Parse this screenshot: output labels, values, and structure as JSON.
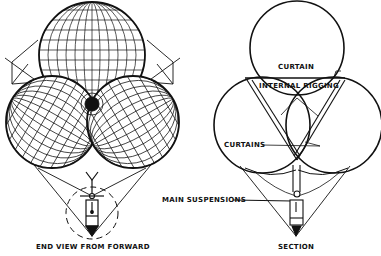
{
  "figures": {
    "left": {
      "caption": "END VIEW FROM FORWARD"
    },
    "right": {
      "caption": "SECTION",
      "labels": {
        "curtain": "CURTAIN",
        "internal_rigging": "INTERNAL RIGGING",
        "curtains": "CURTAINS",
        "main_suspensions": "MAIN SUSPENSIONS"
      }
    }
  },
  "colors": {
    "ink": "#111111",
    "paper": "#ffffff"
  }
}
